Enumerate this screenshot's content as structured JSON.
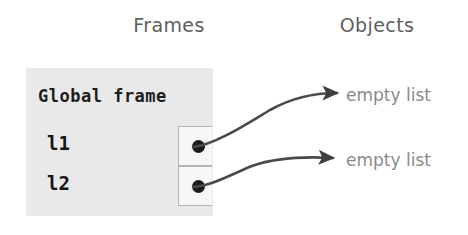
{
  "columns": {
    "frames_header": "Frames",
    "objects_header": "Objects"
  },
  "frame": {
    "title": "Global frame",
    "background_color": "#e9e9e9",
    "variables": [
      {
        "name": "l1",
        "points_to": "empty list"
      },
      {
        "name": "l2",
        "points_to": "empty list"
      }
    ]
  },
  "objects": [
    {
      "label": "empty list"
    },
    {
      "label": "empty list"
    }
  ],
  "colors": {
    "header_text": "#5e5e5e",
    "frame_fill": "#e9e9e9",
    "frame_title_text": "#1d1d1d",
    "variable_text": "#161616",
    "object_text": "#8a8a8a",
    "pointer_dot": "#1a1a1a",
    "arrow": "#4a4a4a",
    "cell_border": "#b4b4b4",
    "page_background": "#ffffff"
  }
}
